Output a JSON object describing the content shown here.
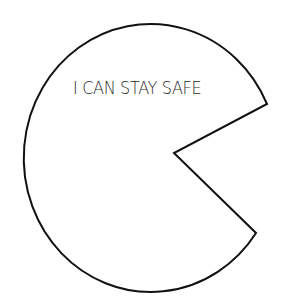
{
  "figure": {
    "shape": "pac-man",
    "label": "I CAN STAY SAFE",
    "stroke_color": "#111111",
    "fill_color": "#ffffff",
    "text_color": "#2a2a2a",
    "geometry": {
      "center": [
        145,
        156
      ],
      "radius_x": 127,
      "radius_y": 134,
      "mouth_upper_point": [
        267,
        104
      ],
      "mouth_vertex": [
        174,
        153
      ],
      "mouth_lower_point": [
        256,
        233
      ]
    }
  }
}
